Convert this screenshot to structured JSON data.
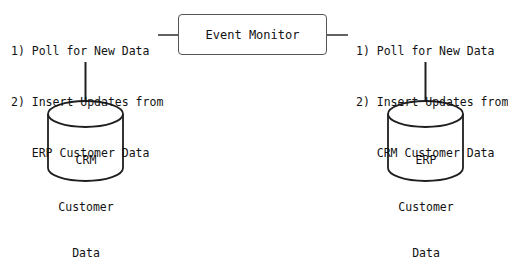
{
  "diagram": {
    "type": "flow-diagram",
    "background_color": "#ffffff",
    "stroke_color": "#1f1f1f",
    "box_stroke_color": "#555555",
    "text_color": "#121212",
    "center_node": {
      "label": "Event Monitor",
      "shape": "rounded-rectangle"
    },
    "left_steps": {
      "line1": "1) Poll for New Data",
      "line2": "2) Insert Updates from",
      "line3": "ERP Customer Data"
    },
    "right_steps": {
      "line1": "1) Poll for New Data",
      "line2": "2) Insert Updates from",
      "line3": "CRM Customer Data"
    },
    "left_datastore": {
      "shape": "cylinder",
      "line1": "CRM",
      "line2": "Customer",
      "line3": "Data"
    },
    "right_datastore": {
      "shape": "cylinder",
      "line1": "ERP",
      "line2": "Customer",
      "line3": "Data"
    },
    "connectors": [
      {
        "name": "left-steps-to-event-monitor",
        "orientation": "horizontal"
      },
      {
        "name": "event-monitor-to-right-steps",
        "orientation": "horizontal"
      },
      {
        "name": "left-steps-to-crm-datastore",
        "orientation": "vertical"
      },
      {
        "name": "right-steps-to-erp-datastore",
        "orientation": "vertical"
      }
    ]
  }
}
